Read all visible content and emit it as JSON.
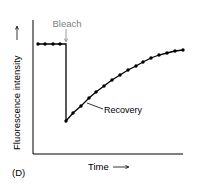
{
  "chart_data": {
    "type": "line",
    "title": "",
    "panel_label": "(D)",
    "xlabel": "Time",
    "ylabel": "Fluorescence intensity",
    "x_axis_arrow": "→",
    "y_axis_arrow": "→",
    "grid": false,
    "legend": null,
    "annotations": [
      {
        "text": "Bleach",
        "color": "#808080",
        "arrow": "down",
        "target_x": 5
      },
      {
        "text": "Recovery",
        "color": "#000000",
        "leader_line": true
      }
    ],
    "series": [
      {
        "name": "Fluorescence",
        "x": [
          0,
          1,
          2,
          3,
          4,
          4,
          5,
          6,
          7,
          8,
          9,
          10,
          11,
          12,
          13,
          14,
          15,
          16,
          17,
          18,
          19
        ],
        "values": [
          0.85,
          0.85,
          0.85,
          0.85,
          0.85,
          0.25,
          0.31,
          0.36,
          0.42,
          0.46,
          0.51,
          0.55,
          0.59,
          0.62,
          0.65,
          0.68,
          0.71,
          0.73,
          0.75,
          0.76,
          0.77
        ],
        "markers": true,
        "color": "#000000"
      }
    ],
    "points_px": [
      [
        38,
        44
      ],
      [
        45,
        44
      ],
      [
        53,
        44
      ],
      [
        60,
        44
      ],
      [
        66,
        44
      ],
      [
        66,
        121
      ],
      [
        73,
        113
      ],
      [
        81,
        106
      ],
      [
        89,
        98
      ],
      [
        96,
        92
      ],
      [
        104,
        86
      ],
      [
        112,
        80
      ],
      [
        120,
        75
      ],
      [
        128,
        70
      ],
      [
        136,
        66
      ],
      [
        143,
        62
      ],
      [
        151,
        58
      ],
      [
        159,
        55
      ],
      [
        167,
        53
      ],
      [
        175,
        51
      ],
      [
        183,
        50
      ]
    ]
  },
  "labels": {
    "bleach": "Bleach",
    "recovery": "Recovery",
    "xlabel": "Time",
    "xarrow": "⟶",
    "ylabel": "Fluorescence intensity",
    "yarrow": "⟶",
    "panel": "(D)"
  }
}
